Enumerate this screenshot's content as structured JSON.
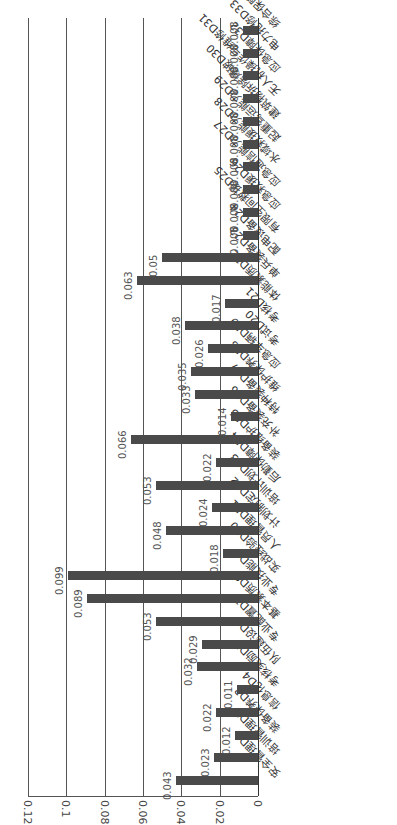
{
  "chart_data": {
    "type": "bar",
    "orientation": "image rotated 90° counter-clockwise (value axis runs right-to-left, categories run bottom-to-top)",
    "title": "",
    "xlabel": "",
    "ylabel": "",
    "ylim": [
      0,
      0.12
    ],
    "yticks": [
      "0",
      "0.02",
      "0.04",
      "0.06",
      "0.08",
      "0.1",
      "0.12"
    ],
    "grid": true,
    "legend": null,
    "categories": [
      "安全管理D1",
      "培训管理D2",
      "装备保养D3",
      "信息化D4",
      "考核奖励D5",
      "队伍建设D6",
      "专业配置D7",
      "基本素质D8",
      "专业技能D9",
      "实战经验D10",
      "人员管理D11",
      "计划制定D12",
      "培训计划D13",
      "后勤保障D14",
      "装备维护D15",
      "补充装备D16",
      "特种装备D17",
      "维护保养D18",
      "应急车辆D19",
      "考试D20",
      "考核D21",
      "体能素质D22",
      "单兵装备D23",
      "配电设备D24",
      "有限空间救援D25",
      "应急救援D26",
      "应急通信能力D27",
      "水域救援能力D28",
      "起重驾运能力D29",
      "建筑物拆除爆破D30",
      "无人机操作与维修D31",
      "应急保障D32",
      "电力抢修D33",
      "综合保障D34"
    ],
    "values": [
      0.043,
      0.023,
      0.012,
      0.022,
      0.011,
      0.032,
      0.029,
      0.053,
      0.089,
      0.099,
      0.018,
      0.048,
      0.024,
      0.053,
      0.022,
      0.066,
      0.014,
      0.033,
      0.035,
      0.026,
      0.038,
      0.017,
      0.063,
      0.05,
      0.008,
      0.008,
      0.008,
      0.008,
      0.008,
      0.008,
      0.008,
      0.008,
      0.008,
      0.008
    ],
    "value_labels": [
      "0.043",
      "0.023",
      "0.012",
      "0.022",
      "0.011",
      "0.032",
      "0.029",
      "0.053",
      "0.089",
      "0.099",
      "0.018",
      "0.048",
      "0.024",
      "0.053",
      "0.022",
      "0.066",
      "0.014",
      "0.033",
      "0.035",
      "0.026",
      "0.038",
      "0.017",
      "0.063",
      "0.05",
      "0.008",
      "0.008",
      "0.008",
      "0.008",
      "0.008",
      "0.008",
      "0.008",
      "0.008",
      "0.008",
      "0.008"
    ],
    "bar_color": "#4a4a4a"
  }
}
